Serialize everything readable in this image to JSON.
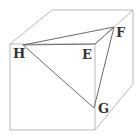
{
  "diagram": {
    "type": "cube-with-triangle",
    "labels": {
      "H": "H",
      "E": "E",
      "F": "F",
      "G": "G"
    },
    "colors": {
      "cube_edges": "#b8b8b8",
      "triangle_edges": "#6a6a6a",
      "label_text": "#333333"
    }
  }
}
